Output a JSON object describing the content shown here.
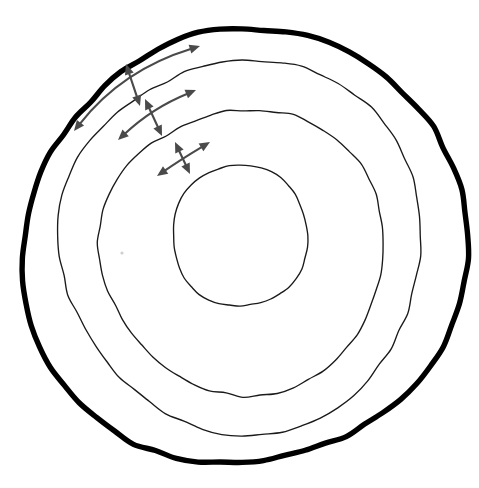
{
  "figure": {
    "background_color": "#ffffff",
    "width": 479,
    "height": 488,
    "ring_stroke_color": "#1a1a1a",
    "outer_ring_stroke_color": "#000000",
    "arrow_color": "#4a4a4a"
  },
  "rings": [
    {
      "id": "ring-1-outermost",
      "label": "Outermost boundary",
      "emphasis": "bold",
      "stroke_width": 5.4,
      "bounds": {
        "left": 27,
        "top": 28,
        "right": 458,
        "bottom": 464
      },
      "path": "M 240 28 C 262 28 286 33 308 40 C 330 47 350 56 368 67 C 386 78 402 91 416 106 C 430 121 441 138 448 157 C 455 176 458 196 458 217 C 458 238 456 259 452 279 C 448 299 442 319 434 338 C 426 357 416 375 404 391 C 392 407 378 421 362 433 C 346 445 328 454 309 459 C 290 464 270 464 250 463 C 230 462 210 459 190 455 C 170 451 150 446 131 438 C 112 430 94 420 78 407 C 62 394 49 378 40 360 C 31 342 28 322 27 302 C 26 282 28 262 31 242 C 34 222 38 202 41 182 C 44 162 47 142 53 123 C 59 104 69 87 82 72 C 95 57 112 46 131 39 C 150 32 171 29 191 28 C 207 27 224 28 240 28 Z",
      "wobble": [
        {
          "at": 0.04,
          "amp": 2.4
        },
        {
          "at": 0.12,
          "amp": -2.1
        },
        {
          "at": 0.2,
          "amp": 2.8
        },
        {
          "at": 0.3,
          "amp": -1.9
        },
        {
          "at": 0.42,
          "amp": 2.6
        },
        {
          "at": 0.55,
          "amp": -2.4
        },
        {
          "at": 0.68,
          "amp": 2.2
        },
        {
          "at": 0.8,
          "amp": -2.7
        },
        {
          "at": 0.9,
          "amp": 2.0
        }
      ]
    },
    {
      "id": "ring-2",
      "label": "Second ring",
      "emphasis": "thin",
      "stroke_width": 1.35,
      "bounds": {
        "left": 60,
        "top": 61,
        "right": 424,
        "bottom": 430
      }
    },
    {
      "id": "ring-3",
      "label": "Third ring",
      "emphasis": "thin",
      "stroke_width": 1.35,
      "bounds": {
        "left": 104,
        "top": 110,
        "right": 390,
        "bottom": 392
      }
    },
    {
      "id": "ring-4-innermost",
      "label": "Innermost core",
      "emphasis": "thin",
      "stroke_width": 1.35,
      "bounds": {
        "left": 172,
        "top": 165,
        "right": 307,
        "bottom": 306
      }
    }
  ],
  "arrow_pairs": [
    {
      "id": "arrow-pair-1",
      "label": "Outermost band expansion arrows",
      "between_rings": [
        "ring-1-outermost",
        "ring-2"
      ],
      "tangential": {
        "id": "tangential-arrow-1",
        "label": "Tangential double-headed arrow 1",
        "double_headed": true,
        "curved": true,
        "start": {
          "x": 74,
          "y": 131
        },
        "control": {
          "x": 122,
          "y": 70
        },
        "end": {
          "x": 200,
          "y": 46
        }
      },
      "radial": {
        "id": "radial-arrow-1",
        "label": "Radial double-headed arrow 1",
        "double_headed": true,
        "curved": false,
        "start": {
          "x": 126,
          "y": 64
        },
        "end": {
          "x": 140,
          "y": 106
        }
      }
    },
    {
      "id": "arrow-pair-2",
      "label": "Middle band expansion arrows",
      "between_rings": [
        "ring-2",
        "ring-3"
      ],
      "tangential": {
        "id": "tangential-arrow-2",
        "label": "Tangential double-headed arrow 2",
        "double_headed": true,
        "curved": true,
        "start": {
          "x": 118,
          "y": 140
        },
        "control": {
          "x": 152,
          "y": 108
        },
        "end": {
          "x": 196,
          "y": 90
        }
      },
      "radial": {
        "id": "radial-arrow-2",
        "label": "Radial double-headed arrow 2",
        "double_headed": true,
        "curved": false,
        "start": {
          "x": 145,
          "y": 99
        },
        "end": {
          "x": 162,
          "y": 136
        }
      }
    },
    {
      "id": "arrow-pair-3",
      "label": "Inner band expansion arrows",
      "between_rings": [
        "ring-3",
        "ring-4-innermost"
      ],
      "tangential": {
        "id": "tangential-arrow-3",
        "label": "Tangential double-headed arrow 3",
        "double_headed": true,
        "curved": true,
        "start": {
          "x": 157,
          "y": 176
        },
        "control": {
          "x": 180,
          "y": 160
        },
        "end": {
          "x": 210,
          "y": 142
        }
      },
      "radial": {
        "id": "radial-arrow-3",
        "label": "Radial double-headed arrow 3",
        "double_headed": true,
        "curved": false,
        "start": {
          "x": 175,
          "y": 142
        },
        "end": {
          "x": 190,
          "y": 174
        }
      }
    }
  ],
  "marks": [
    {
      "id": "faint-speck",
      "label": "Faint light-gray speck",
      "x": 122,
      "y": 253,
      "radius": 1.6,
      "color": "#cfcfcf"
    }
  ]
}
